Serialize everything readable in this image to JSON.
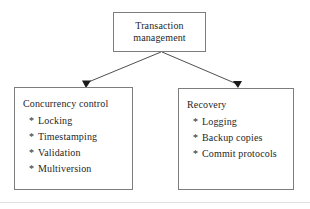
{
  "diagram": {
    "type": "hierarchy-tree",
    "background_color": "#ffffff",
    "border_color": "#7d7d7d",
    "text_color": "#262626",
    "root": {
      "title_line_1": "Transaction",
      "title_line_2": "management"
    },
    "children": [
      {
        "heading": "Concurrency control",
        "bullet_char": "*",
        "items": [
          "Locking",
          "Timestamping",
          "Validation",
          "Multiversion"
        ]
      },
      {
        "heading": "Recovery",
        "bullet_char": "*",
        "items": [
          "Logging",
          "Backup copies",
          "Commit protocols"
        ]
      }
    ]
  }
}
